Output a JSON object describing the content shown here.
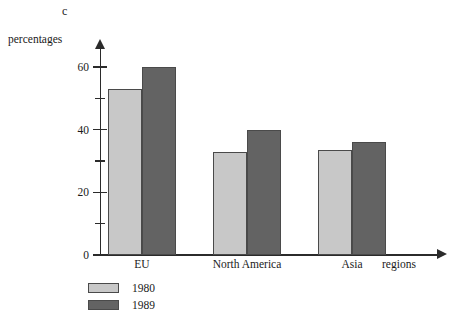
{
  "figure": {
    "letter": "c"
  },
  "chart_data": {
    "type": "bar",
    "title": "",
    "xlabel": "regions",
    "ylabel": "percentages",
    "categories": [
      "EU",
      "North America",
      "Asia"
    ],
    "series": [
      {
        "name": "1980",
        "values": [
          53,
          33,
          33.5
        ],
        "color": "#c8c8c8"
      },
      {
        "name": "1989",
        "values": [
          60,
          40,
          36
        ],
        "color": "#636363"
      }
    ],
    "ylim": [
      0,
      68
    ],
    "yticks": [
      0,
      20,
      40,
      60
    ],
    "yticks_minor": [
      10,
      30,
      50
    ],
    "ytick_labels": [
      "0",
      "20",
      "40",
      "60"
    ],
    "grid": false,
    "legend_position": "bottom-left",
    "axis_color": "#2b2b2b"
  }
}
